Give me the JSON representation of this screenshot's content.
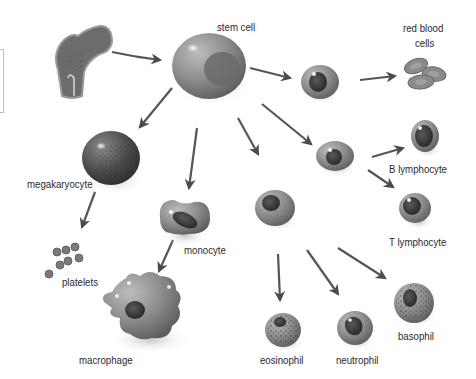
{
  "diagram": {
    "type": "hematopoiesis-lineage",
    "nodes": [
      {
        "id": "bone",
        "label": ""
      },
      {
        "id": "stem_cell",
        "label": "stem cell"
      },
      {
        "id": "erythroid_progenitor",
        "label": ""
      },
      {
        "id": "red_blood_cells",
        "label_line1": "red blood",
        "label_line2": "cells"
      },
      {
        "id": "lymphoid_progenitor",
        "label": ""
      },
      {
        "id": "b_lymphocyte",
        "label": "B lymphocyte"
      },
      {
        "id": "t_lymphocyte",
        "label": "T lymphocyte"
      },
      {
        "id": "megakaryocyte",
        "label": "megakaryocyte"
      },
      {
        "id": "platelets",
        "label": "platelets"
      },
      {
        "id": "monocyte",
        "label": "monocyte"
      },
      {
        "id": "macrophage",
        "label": "macrophage"
      },
      {
        "id": "myeloid_progenitor",
        "label": ""
      },
      {
        "id": "eosinophil",
        "label": "eosinophil"
      },
      {
        "id": "neutrophil",
        "label": "neutrophil"
      },
      {
        "id": "basophil",
        "label": "basophil"
      }
    ],
    "edges": [
      [
        "bone",
        "stem_cell"
      ],
      [
        "stem_cell",
        "erythroid_progenitor"
      ],
      [
        "erythroid_progenitor",
        "red_blood_cells"
      ],
      [
        "stem_cell",
        "lymphoid_progenitor"
      ],
      [
        "lymphoid_progenitor",
        "b_lymphocyte"
      ],
      [
        "lymphoid_progenitor",
        "t_lymphocyte"
      ],
      [
        "stem_cell",
        "megakaryocyte"
      ],
      [
        "megakaryocyte",
        "platelets"
      ],
      [
        "stem_cell",
        "monocyte"
      ],
      [
        "monocyte",
        "macrophage"
      ],
      [
        "stem_cell",
        "myeloid_progenitor"
      ],
      [
        "myeloid_progenitor",
        "eosinophil"
      ],
      [
        "myeloid_progenitor",
        "neutrophil"
      ],
      [
        "myeloid_progenitor",
        "basophil"
      ]
    ],
    "colors": {
      "cell_fill": "#8a8a8a",
      "nucleus": "#3c3c3c",
      "arrow": "#4a4a4a",
      "text": "#2a2a2a",
      "background": "#ffffff"
    }
  }
}
